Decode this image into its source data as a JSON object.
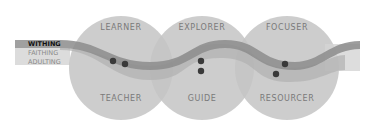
{
  "circles": {
    "top": [
      "LEARNER",
      "EXPLORER",
      "FOCUSER"
    ],
    "bottom": [
      "TEACHER",
      "GUIDE",
      "RESOURCER"
    ]
  },
  "legend": [
    "WITHING",
    "FAITHING",
    "ADULTING"
  ],
  "colors": {
    "circle": "#c4c4c4",
    "band_dark": "#8f8f8f",
    "band_light": "#b5b5b5",
    "band_lightest": "#d6d6d6",
    "dot": "#3a3a3a",
    "label": "#7a7a7a"
  }
}
